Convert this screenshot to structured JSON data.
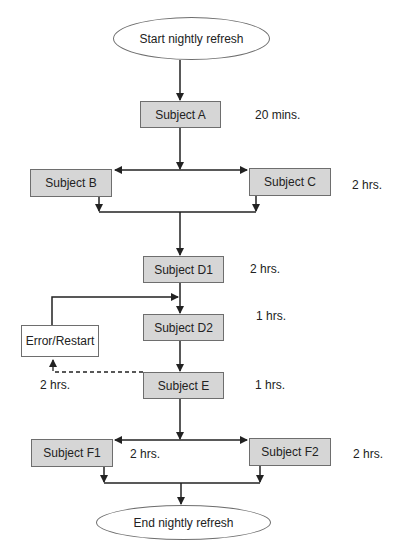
{
  "diagram": {
    "start": "Start nightly refresh",
    "end": "End nightly refresh",
    "nodes": {
      "a": {
        "label": "Subject A",
        "duration": "20 mins."
      },
      "b": {
        "label": "Subject B"
      },
      "c": {
        "label": "Subject C",
        "duration": "2 hrs."
      },
      "d1": {
        "label": "Subject D1",
        "duration": "2 hrs."
      },
      "d2": {
        "label": "Subject D2",
        "duration": "1 hrs."
      },
      "error": {
        "label": "Error/Restart",
        "duration": "2 hrs."
      },
      "e": {
        "label": "Subject E",
        "duration": "1 hrs."
      },
      "f1": {
        "label": "Subject F1",
        "duration": "2 hrs."
      },
      "f2": {
        "label": "Subject F2",
        "duration": "2 hrs."
      }
    },
    "colors": {
      "box_fill": "#d6d6d6",
      "stroke": "#222222",
      "border": "#6e6e6e"
    }
  }
}
